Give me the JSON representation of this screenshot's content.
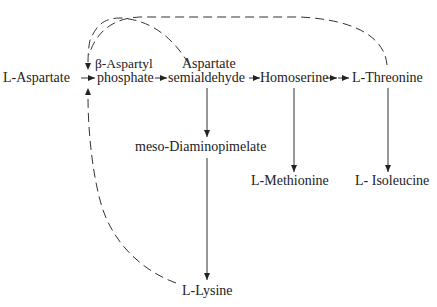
{
  "diagram": {
    "nodes": {
      "aspartate": "L-Aspartate",
      "aspartyl_phosphate_line1": "β-Aspartyl",
      "aspartyl_phosphate_line2": "phosphate",
      "semialdehyde_line1": "Aspartate",
      "semialdehyde_line2": "semialdehyde",
      "homoserine": "Homoserine",
      "threonine": "L-Threonine",
      "diaminopimelate": "meso-Diaminopimelate",
      "methionine": "L-Methionine",
      "isoleucine": "L- Isoleucine",
      "lysine": "L-Lysine"
    },
    "edges": [
      {
        "from": "L-Aspartate",
        "to": "β-Aspartyl phosphate",
        "style": "solid"
      },
      {
        "from": "β-Aspartyl phosphate",
        "to": "Aspartate semialdehyde",
        "style": "solid"
      },
      {
        "from": "Aspartate semialdehyde",
        "to": "Homoserine",
        "style": "solid"
      },
      {
        "from": "Homoserine",
        "to": "L-Threonine",
        "style": "solid",
        "steps": 2
      },
      {
        "from": "Aspartate semialdehyde",
        "to": "meso-Diaminopimelate",
        "style": "solid"
      },
      {
        "from": "meso-Diaminopimelate",
        "to": "L-Lysine",
        "style": "solid"
      },
      {
        "from": "Homoserine",
        "to": "L-Methionine",
        "style": "solid"
      },
      {
        "from": "L-Threonine",
        "to": "L- Isoleucine",
        "style": "solid"
      },
      {
        "from": "L-Threonine",
        "to": "L-Aspartate → β-Aspartyl phosphate step",
        "style": "dashed",
        "meaning": "feedback inhibition"
      },
      {
        "from": "L-Lysine",
        "to": "L-Aspartate → β-Aspartyl phosphate step",
        "style": "dashed",
        "meaning": "feedback inhibition"
      }
    ],
    "colors": {
      "ink": "#222222",
      "background": "#ffffff"
    }
  }
}
